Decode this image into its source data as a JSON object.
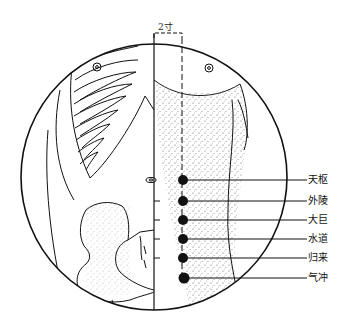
{
  "figure": {
    "measure_label": "2寸",
    "colors": {
      "ink": "#111111",
      "background": "#ffffff"
    }
  },
  "points": [
    {
      "name": "天枢",
      "y": 180
    },
    {
      "name": "外陵",
      "y": 201
    },
    {
      "name": "大巨",
      "y": 220
    },
    {
      "name": "水道",
      "y": 239
    },
    {
      "name": "归来",
      "y": 258
    },
    {
      "name": "气冲",
      "y": 278
    }
  ]
}
